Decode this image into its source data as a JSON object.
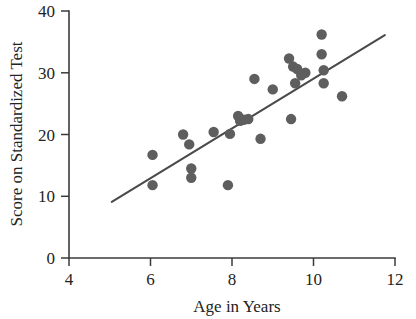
{
  "chart_data": {
    "type": "scatter",
    "title": "",
    "xlabel": "Age in Years",
    "ylabel": "Score on Standardized Test",
    "xlim": [
      4,
      12
    ],
    "ylim": [
      0,
      40
    ],
    "xticks": [
      4,
      6,
      8,
      10,
      12
    ],
    "yticks": [
      0,
      10,
      20,
      30,
      40
    ],
    "xtick_labels": [
      "4",
      "6",
      "8",
      "10",
      "12"
    ],
    "ytick_labels": [
      "0",
      "10",
      "20",
      "30",
      "40"
    ],
    "grid": false,
    "legend": null,
    "marker": "filled-circle",
    "marker_color": "#5e5e5e",
    "points": [
      {
        "x": 6.05,
        "y": 16.7
      },
      {
        "x": 6.05,
        "y": 11.8
      },
      {
        "x": 6.8,
        "y": 20.0
      },
      {
        "x": 6.95,
        "y": 18.4
      },
      {
        "x": 7.0,
        "y": 14.5
      },
      {
        "x": 7.0,
        "y": 13.0
      },
      {
        "x": 7.55,
        "y": 20.4
      },
      {
        "x": 7.95,
        "y": 20.1
      },
      {
        "x": 7.9,
        "y": 11.8
      },
      {
        "x": 8.15,
        "y": 23.0
      },
      {
        "x": 8.2,
        "y": 22.2
      },
      {
        "x": 8.3,
        "y": 22.4
      },
      {
        "x": 8.4,
        "y": 22.5
      },
      {
        "x": 8.55,
        "y": 29.0
      },
      {
        "x": 8.7,
        "y": 19.3
      },
      {
        "x": 9.0,
        "y": 27.3
      },
      {
        "x": 9.4,
        "y": 32.3
      },
      {
        "x": 9.45,
        "y": 22.5
      },
      {
        "x": 9.5,
        "y": 31.0
      },
      {
        "x": 9.55,
        "y": 28.3
      },
      {
        "x": 9.6,
        "y": 30.6
      },
      {
        "x": 9.7,
        "y": 29.6
      },
      {
        "x": 9.8,
        "y": 30.0
      },
      {
        "x": 10.2,
        "y": 36.2
      },
      {
        "x": 10.2,
        "y": 33.0
      },
      {
        "x": 10.25,
        "y": 30.4
      },
      {
        "x": 10.25,
        "y": 28.3
      },
      {
        "x": 10.7,
        "y": 26.2
      }
    ],
    "fit_line": {
      "type": "linear-regression",
      "x_start": 5.05,
      "y_start": 9.1,
      "x_end": 11.75,
      "y_end": 36.1,
      "color": "#4a4a4a"
    }
  },
  "axes": {
    "x_title": "Age in Years",
    "y_title": "Score on Standardized Test"
  }
}
